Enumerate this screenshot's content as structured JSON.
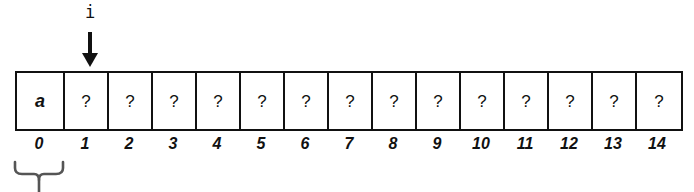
{
  "figure": {
    "pointer": {
      "label": "i",
      "points_to_index": 1,
      "arrow_icon": "down-arrow-icon"
    },
    "array": {
      "cell_count": 15,
      "cells": [
        {
          "index": "0",
          "value": "a"
        },
        {
          "index": "1",
          "value": "?"
        },
        {
          "index": "2",
          "value": "?"
        },
        {
          "index": "3",
          "value": "?"
        },
        {
          "index": "4",
          "value": "?"
        },
        {
          "index": "5",
          "value": "?"
        },
        {
          "index": "6",
          "value": "?"
        },
        {
          "index": "7",
          "value": "?"
        },
        {
          "index": "8",
          "value": "?"
        },
        {
          "index": "9",
          "value": "?"
        },
        {
          "index": "10",
          "value": "?"
        },
        {
          "index": "11",
          "value": "?"
        },
        {
          "index": "12",
          "value": "?"
        },
        {
          "index": "13",
          "value": "?"
        },
        {
          "index": "14",
          "value": "?"
        }
      ]
    },
    "brace": {
      "icon": "curly-brace-down-icon",
      "spans_index": "0"
    },
    "colors": {
      "stroke": "#111111",
      "background": "#ffffff",
      "brace_stroke": "#555555"
    }
  }
}
